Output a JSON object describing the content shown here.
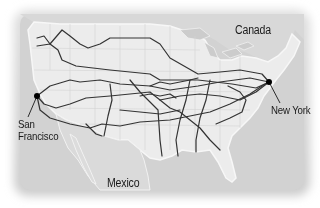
{
  "map": {
    "regions": {
      "north": "Canada",
      "south": "Mexico"
    },
    "markers": [
      {
        "name": "San Francisco",
        "line1": "San",
        "line2": "Francisco",
        "x": 37,
        "y": 96
      },
      {
        "name": "New York",
        "line1": "New York",
        "x": 269,
        "y": 82
      }
    ],
    "colors": {
      "background": "#ffffff",
      "water": "#cfcfcf",
      "foreign_land": "#d4d4d4",
      "us_land": "#ececec",
      "state_borders": "#d0d0d0",
      "routes": "#333333",
      "marker": "#000000",
      "text": "#1a1a1a"
    }
  }
}
